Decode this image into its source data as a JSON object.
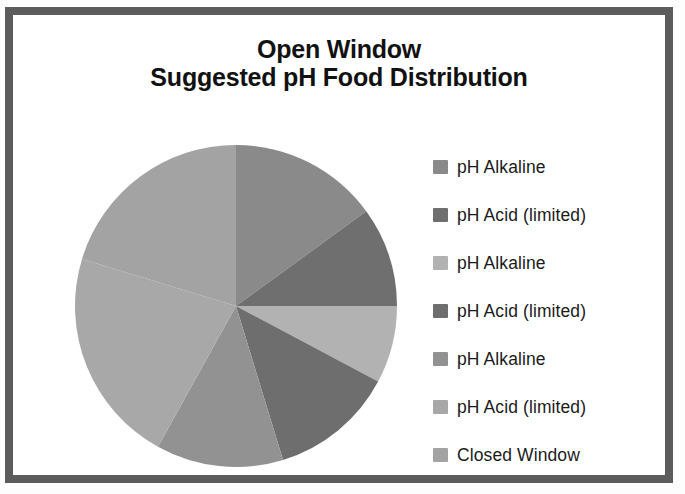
{
  "frame": {
    "border_color": "#5c5c5c",
    "background": "#ffffff"
  },
  "title": {
    "line1": "Open Window",
    "line2": "Suggested pH Food Distribution"
  },
  "legend": {
    "items": [
      {
        "label": "pH Alkaline",
        "color": "#8a8a8a"
      },
      {
        "label": "pH Acid (limited)",
        "color": "#6f6f6f"
      },
      {
        "label": "pH Alkaline",
        "color": "#b2b2b2"
      },
      {
        "label": "pH Acid (limited)",
        "color": "#6e6e6e"
      },
      {
        "label": "pH Alkaline",
        "color": "#929292"
      },
      {
        "label": "pH Acid (limited)",
        "color": "#a8a8a8"
      },
      {
        "label": "Closed Window",
        "color": "#a3a3a3"
      }
    ]
  },
  "ghosts": [
    {
      "text": "Distribution",
      "x": 150,
      "y": 22,
      "size": 26
    },
    {
      "text": "8",
      "x": 32,
      "y": 330,
      "size": 16
    },
    {
      "text": "sec to",
      "x": 190,
      "y": 110,
      "size": 22
    },
    {
      "text": "A 15",
      "x": 600,
      "y": 95,
      "size": 18
    },
    {
      "text": "PUBLIC",
      "x": 560,
      "y": 420,
      "size": 17
    }
  ],
  "chart_data": {
    "type": "pie",
    "title": "Open Window\nSuggested pH Food Distribution",
    "legend_position": "right",
    "grid": false,
    "start_angle_deg": 0,
    "direction": "clockwise",
    "labels": [
      "pH Alkaline",
      "pH Acid (limited)",
      "pH Alkaline",
      "pH Acid (limited)",
      "pH Alkaline",
      "pH Acid (limited)",
      "Closed Window"
    ],
    "values": [
      15,
      10,
      8,
      12,
      13,
      22,
      20
    ],
    "angles_deg": [
      54,
      36,
      28,
      45,
      46,
      78,
      73
    ],
    "colors": [
      "#8a8a8a",
      "#6f6f6f",
      "#b2b2b2",
      "#6e6e6e",
      "#929292",
      "#a8a8a8",
      "#a3a3a3"
    ],
    "center": {
      "x": 165,
      "y": 165
    },
    "radius": 161
  }
}
